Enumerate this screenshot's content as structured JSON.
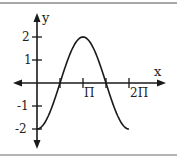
{
  "chart_data": {
    "type": "line",
    "title": "",
    "function": "y = -2cos(x)",
    "xlabel": "x",
    "ylabel": "y",
    "x_ticks": [
      {
        "value": 1.5708,
        "label": ""
      },
      {
        "value": 3.1416,
        "label": "Π"
      },
      {
        "value": 4.7124,
        "label": ""
      },
      {
        "value": 6.2832,
        "label": "2Π"
      }
    ],
    "y_ticks": [
      {
        "value": 2,
        "label": "2"
      },
      {
        "value": 1,
        "label": "1"
      },
      {
        "value": -1,
        "label": "-1"
      },
      {
        "value": -2,
        "label": "-2"
      }
    ],
    "x_range": [
      0,
      6.2832
    ],
    "ylim": [
      -2,
      2
    ],
    "series": [
      {
        "name": "y = -2cos(x)",
        "x": [
          0,
          0.7854,
          1.5708,
          2.3562,
          3.1416,
          3.927,
          4.7124,
          5.4978,
          6.2832
        ],
        "values": [
          -2,
          -1.41,
          0,
          1.41,
          2,
          1.41,
          0,
          -1.41,
          -2
        ]
      }
    ],
    "grid": false,
    "legend": "none"
  },
  "labels": {
    "x_axis": "x",
    "y_axis": "y",
    "pi": "Π",
    "two_pi": "2Π",
    "y2": "2",
    "y1": "1",
    "ym1": "-1",
    "ym2": "-2"
  },
  "colors": {
    "axis": "#1a1a1a",
    "curve": "#1a1a1a",
    "border": "#a8a8a8"
  }
}
